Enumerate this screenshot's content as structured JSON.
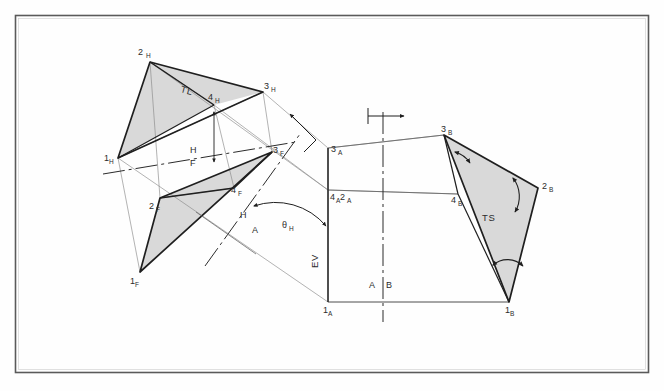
{
  "sheet": {
    "title": "Descriptive geometry construction: true size of oblique plane by successive auxiliary views",
    "background_color": "#fefefe",
    "border_color": "#555555",
    "line_color": "#3a3a3a",
    "shade_color": "#d9d9d9"
  },
  "labels": {
    "two_h": {
      "main": "2",
      "sub": "H"
    },
    "three_h": {
      "main": "3",
      "sub": "H"
    },
    "four_h": {
      "main": "4",
      "sub": "H"
    },
    "one_h": {
      "main": "1",
      "sub": "H"
    },
    "one_f": {
      "main": "1",
      "sub": "F"
    },
    "two_f": {
      "main": "2",
      "sub": "F"
    },
    "three_f": {
      "main": "3",
      "sub": "F"
    },
    "four_f": {
      "main": "4",
      "sub": "F"
    },
    "three_a": {
      "main": "3",
      "sub": "A"
    },
    "four_a_two_a": {
      "main": "4",
      "sub1": "A",
      "main2": "2",
      "sub2": "A"
    },
    "one_a": {
      "main": "1",
      "sub": "A"
    },
    "three_b": {
      "main": "3",
      "sub": "B"
    },
    "four_b": {
      "main": "4",
      "sub": "B"
    },
    "two_b": {
      "main": "2",
      "sub": "B"
    },
    "one_b": {
      "main": "1",
      "sub": "B"
    },
    "true_length": "TL",
    "true_size": "TS",
    "edge_view": "EV",
    "theta": {
      "main": "θ",
      "sub": "H"
    },
    "fold_hf_top": "H",
    "fold_hf_bottom": "F",
    "fold_ha_top": "H",
    "fold_ha_bottom": "A",
    "fold_ab_left": "A",
    "fold_ab_right": "B"
  },
  "geometry": {
    "frame": {
      "x": 15,
      "y": 15,
      "w": 634,
      "h": 358
    },
    "top_view": {
      "p1H": [
        118,
        158
      ],
      "p2H": [
        150,
        62
      ],
      "p3H": [
        263,
        92
      ],
      "p4H": [
        214,
        105
      ]
    },
    "front_view": {
      "p1F": [
        140,
        272
      ],
      "p2F": [
        160,
        198
      ],
      "p3F": [
        272,
        152
      ],
      "p4F": [
        234,
        188
      ]
    },
    "aux_view_a": {
      "p3A": [
        328,
        148
      ],
      "p4A2A": [
        328,
        190
      ],
      "p1A": [
        328,
        302
      ]
    },
    "aux_view_b": {
      "p3B": [
        444,
        135
      ],
      "p4B": [
        458,
        194
      ],
      "p2B": [
        538,
        188
      ],
      "p1B": [
        509,
        302
      ]
    },
    "fold_hf": {
      "from": [
        108,
        173
      ],
      "to": [
        292,
        143
      ]
    },
    "fold_ha": {
      "from": [
        210,
        262
      ],
      "to": [
        295,
        143
      ]
    },
    "fold_ab": {
      "from": [
        383,
        115
      ],
      "to": [
        383,
        320
      ]
    }
  },
  "annotations": {
    "sight_arrow_aux_a": "arrow-to-upper-right",
    "sight_arrow_aux_b": "arrow-to-right",
    "angle_marker_theta": "double-headed-arc",
    "angle_markers_ts": [
      "arc-at-3B",
      "arc-at-2B",
      "arc-at-1B"
    ],
    "projector_tick_4h": "double-headed-vertical-arrow"
  }
}
